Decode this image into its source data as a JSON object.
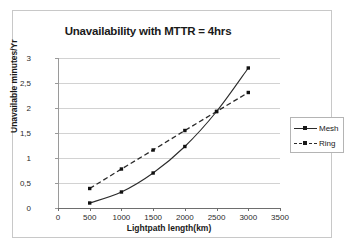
{
  "chart_data": {
    "type": "line",
    "title": "Unavailability with MTTR = 4hrs",
    "xlabel": "Lightpath length(km)",
    "ylabel": "Unavailable minutes/Yr",
    "x": [
      500,
      1000,
      1500,
      2000,
      2500,
      3000
    ],
    "xlim": [
      0,
      3500
    ],
    "ylim": [
      0,
      3
    ],
    "xticks": [
      "0",
      "500",
      "1000",
      "1500",
      "2000",
      "2500",
      "3000",
      "3500"
    ],
    "xtick_values": [
      0,
      500,
      1000,
      1500,
      2000,
      2500,
      3000,
      3500
    ],
    "yticks": [
      "0",
      "0,5",
      "1",
      "1,5",
      "2",
      "2,5",
      "3"
    ],
    "ytick_values": [
      0,
      0.5,
      1,
      1.5,
      2,
      2.5,
      3
    ],
    "grid": "horizontal",
    "legend_position": "right",
    "series": [
      {
        "name": "Mesh",
        "style": "solid",
        "marker": "square",
        "color": "#2b2b2b",
        "values": [
          0.1,
          0.32,
          0.7,
          1.23,
          1.93,
          2.8
        ]
      },
      {
        "name": "Ring",
        "style": "dashed",
        "marker": "square",
        "color": "#2b2b2b",
        "values": [
          0.39,
          0.78,
          1.16,
          1.55,
          1.93,
          2.31
        ]
      }
    ]
  },
  "legend": {
    "items": [
      {
        "label": "Mesh"
      },
      {
        "label": "Ring"
      }
    ]
  }
}
